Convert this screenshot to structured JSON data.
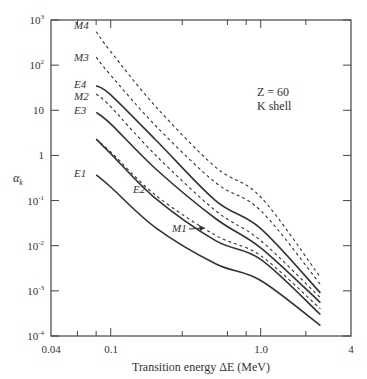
{
  "chart_data": {
    "type": "line",
    "title": "",
    "xlabel": "Transition energy ΔE (MeV)",
    "ylabel": "αk",
    "xscale": "log",
    "yscale": "log",
    "xlim": [
      0.04,
      4
    ],
    "ylim": [
      0.0001,
      1000
    ],
    "x_tick_labels": [
      "0.04",
      "0.1",
      "1.0",
      "4"
    ],
    "x_tick_values": [
      0.04,
      0.1,
      1.0,
      4
    ],
    "y_tick_labels": [
      "10^-4",
      "10^-3",
      "10^-2",
      "10^-1",
      "1",
      "10",
      "10^2",
      "10^3"
    ],
    "y_tick_values": [
      0.0001,
      0.001,
      0.01,
      0.1,
      1,
      10,
      100,
      1000
    ],
    "grid": false,
    "annotations": [
      "Z = 60",
      "K shell"
    ],
    "x": [
      0.08,
      0.1,
      0.2,
      0.5,
      1.0,
      2.5
    ],
    "series": [
      {
        "name": "M4",
        "style": "dashed",
        "values": [
          550,
          200,
          12,
          0.55,
          0.12,
          0.002
        ]
      },
      {
        "name": "M3",
        "style": "dashed",
        "values": [
          150,
          60,
          4.5,
          0.25,
          0.06,
          0.0014
        ]
      },
      {
        "name": "E4",
        "style": "solid",
        "values": [
          35,
          22,
          2.2,
          0.1,
          0.024,
          0.0009
        ]
      },
      {
        "name": "M2",
        "style": "dashed",
        "values": [
          23,
          12,
          1.0,
          0.06,
          0.013,
          0.0007
        ]
      },
      {
        "name": "E3",
        "style": "solid",
        "values": [
          9,
          5,
          0.5,
          0.04,
          0.009,
          0.00055
        ]
      },
      {
        "name": "M1",
        "style": "dashed",
        "values": [
          2.3,
          1.2,
          0.13,
          0.017,
          0.006,
          0.0004
        ]
      },
      {
        "name": "E2",
        "style": "solid",
        "values": [
          2.3,
          1.1,
          0.11,
          0.013,
          0.005,
          0.0003
        ]
      },
      {
        "name": "E1",
        "style": "solid",
        "values": [
          0.37,
          0.2,
          0.025,
          0.004,
          0.0017,
          0.00017
        ]
      }
    ]
  },
  "labels": {
    "xlabel": "Transition energy ΔE (MeV)",
    "ylabel_main": "α",
    "ylabel_sub": "k",
    "annotation_line1": "Z = 60",
    "annotation_line2": "K shell",
    "curve_M4": "M4",
    "curve_M3": "M3",
    "curve_E4": "E4",
    "curve_M2": "M2",
    "curve_E3": "E3",
    "curve_E2": "E2",
    "curve_E1": "E1",
    "curve_M1": "M1",
    "x_ticks": [
      "0.04",
      "0.1",
      "1.0",
      "4"
    ]
  }
}
